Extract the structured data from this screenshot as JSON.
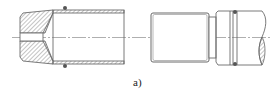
{
  "figure": {
    "label": "a)",
    "colors": {
      "line": "#6b6b6b",
      "hatch": "#8a8a8a",
      "centerline": "#9a9a9a",
      "oring": "#555555",
      "background": "#ffffff"
    },
    "parts": [
      {
        "name": "left-sectioned-nozzle",
        "features": [
          "chamfered nose",
          "hatched section",
          "axial bore",
          "tube wall",
          "o-ring"
        ]
      },
      {
        "name": "right-threaded-fitting",
        "features": [
          "threaded body",
          "neck",
          "collar",
          "o-ring groove",
          "broken shaft with hatched break"
        ]
      }
    ]
  }
}
